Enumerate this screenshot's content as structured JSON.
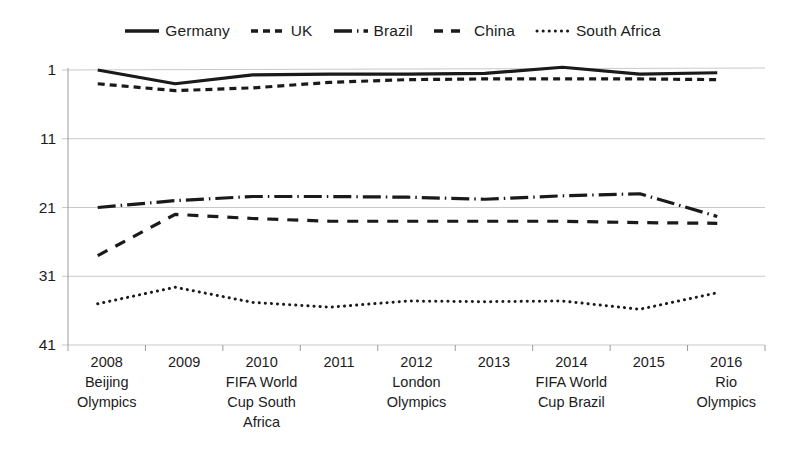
{
  "chart_data": {
    "type": "line",
    "title": "",
    "subtitle": "",
    "xlabel": "",
    "ylabel": "",
    "grid": true,
    "legend_position": "top-center",
    "y_axis_inverted": true,
    "ylim": [
      1,
      41
    ],
    "yticks": [
      1,
      11,
      21,
      31,
      41
    ],
    "x": [
      2008,
      2009,
      2010,
      2011,
      2012,
      2013,
      2014,
      2015,
      2016
    ],
    "categories": [
      "2008 Beijing Olympics",
      "2009",
      "2010 FIFA World Cup South Africa",
      "2011",
      "2012 London Olympics",
      "2013",
      "2014 FIFA World Cup Brazil",
      "2015",
      "2016 Rio Olympics"
    ],
    "tick_labels": [
      {
        "year": "2008",
        "event": "Beijing\nOlympics"
      },
      {
        "year": "2009",
        "event": ""
      },
      {
        "year": "2010",
        "event": "FIFA World\nCup South\nAfrica"
      },
      {
        "year": "2011",
        "event": ""
      },
      {
        "year": "2012",
        "event": "London\nOlympics"
      },
      {
        "year": "2013",
        "event": ""
      },
      {
        "year": "2014",
        "event": "FIFA World\nCup Brazil"
      },
      {
        "year": "2015",
        "event": ""
      },
      {
        "year": "2016",
        "event": "Rio\nOlympics"
      }
    ],
    "series": [
      {
        "name": "Germany",
        "style": "solid",
        "color": "#1a1a1a",
        "values": [
          1.0,
          3.0,
          1.7,
          1.6,
          1.6,
          1.5,
          0.6,
          1.6,
          1.4
        ]
      },
      {
        "name": "UK",
        "style": "short-dash",
        "color": "#1a1a1a",
        "values": [
          3.0,
          4.0,
          3.6,
          2.8,
          2.4,
          2.3,
          2.3,
          2.3,
          2.4
        ]
      },
      {
        "name": "Brazil",
        "style": "dash-dot",
        "color": "#1a1a1a",
        "values": [
          21.0,
          20.0,
          19.4,
          19.4,
          19.5,
          19.8,
          19.3,
          19.0,
          22.3
        ]
      },
      {
        "name": "China",
        "style": "long-dash",
        "color": "#1a1a1a",
        "values": [
          28.0,
          22.0,
          22.6,
          23.0,
          23.0,
          23.0,
          23.0,
          23.2,
          23.3
        ]
      },
      {
        "name": "South Africa",
        "style": "dotted",
        "color": "#1a1a1a",
        "values": [
          35.0,
          32.6,
          34.8,
          35.5,
          34.6,
          34.7,
          34.6,
          35.8,
          33.4
        ]
      }
    ]
  },
  "legend": {
    "items": [
      {
        "label": "Germany",
        "style": "solid"
      },
      {
        "label": "UK",
        "style": "short-dash"
      },
      {
        "label": "Brazil",
        "style": "dash-dot"
      },
      {
        "label": "China",
        "style": "long-dash"
      },
      {
        "label": "South Africa",
        "style": "dotted"
      }
    ]
  },
  "axis": {
    "y_ticks": [
      "1",
      "11",
      "21",
      "31",
      "41"
    ]
  },
  "colors": {
    "line": "#1a1a1a",
    "grid": "#c9c9c9",
    "axis": "#9a9a9a",
    "background": "#ffffff"
  }
}
